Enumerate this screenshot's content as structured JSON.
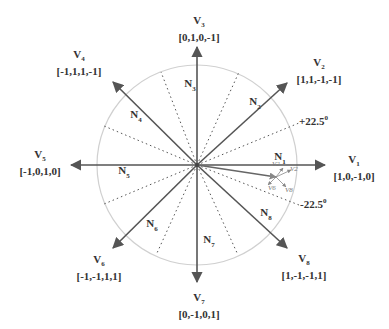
{
  "diagram": {
    "type": "space-vector-diagram",
    "center": [
      197,
      165
    ],
    "circle_radius": 100,
    "colors": {
      "vector": "#555555",
      "circle": "#cccccc",
      "sector_divider": "#555555",
      "text": "#333333"
    },
    "vectors": [
      {
        "id": "V1",
        "name": "V",
        "sub": "1",
        "code": "[1,0,-1,0]",
        "angle_deg": 0
      },
      {
        "id": "V2",
        "name": "V",
        "sub": "2",
        "code": "[1,1,-1,-1]",
        "angle_deg": 45
      },
      {
        "id": "V3",
        "name": "V",
        "sub": "3",
        "code": "[0,1,0,-1]",
        "angle_deg": 90
      },
      {
        "id": "V4",
        "name": "V",
        "sub": "4",
        "code": "[-1,1,1,-1]",
        "angle_deg": 135
      },
      {
        "id": "V5",
        "name": "V",
        "sub": "5",
        "code": "[-1,0,1,0]",
        "angle_deg": 180
      },
      {
        "id": "V6",
        "name": "V",
        "sub": "6",
        "code": "[-1,-1,1,1]",
        "angle_deg": 225
      },
      {
        "id": "V7",
        "name": "V",
        "sub": "7",
        "code": "[0,-1,0,1]",
        "angle_deg": 270
      },
      {
        "id": "V8",
        "name": "V",
        "sub": "8",
        "code": "[1,-1,-1,1]",
        "angle_deg": 315
      }
    ],
    "sectors": [
      {
        "name": "N",
        "sub": "1"
      },
      {
        "name": "N",
        "sub": "2"
      },
      {
        "name": "N",
        "sub": "3"
      },
      {
        "name": "N",
        "sub": "4"
      },
      {
        "name": "N",
        "sub": "5"
      },
      {
        "name": "N",
        "sub": "6"
      },
      {
        "name": "N",
        "sub": "7"
      },
      {
        "name": "N",
        "sub": "8"
      }
    ],
    "angle_labels": {
      "plus": {
        "text": "+22.5",
        "unit": "0"
      },
      "minus": {
        "text": "-22.5",
        "unit": "0"
      }
    },
    "reference_vector_components": [
      "V2",
      "V2",
      "V6",
      "V8"
    ]
  }
}
